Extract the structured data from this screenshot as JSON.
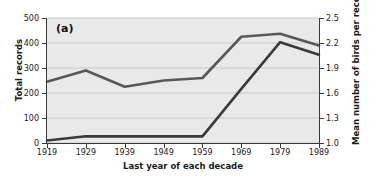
{
  "figure": {
    "panel_label": "(a)",
    "background_color": "#ffffff",
    "plot_background_color": "#e9e9e9",
    "gridline_color": "#c9c9c9"
  },
  "chart_data": {
    "type": "line",
    "title": "",
    "subtitle": "",
    "panel_label": "(a)",
    "xlabel": "Last year of each decade",
    "categories": [
      "1919",
      "1929",
      "1939",
      "1949",
      "1959",
      "1969",
      "1979",
      "1989"
    ],
    "x": [
      1919,
      1929,
      1939,
      1949,
      1959,
      1969,
      1979,
      1989
    ],
    "grid": true,
    "legend_position": "none",
    "axes": [
      {
        "side": "left",
        "label": "Total records",
        "ticks": [
          "0",
          "100",
          "200",
          "300",
          "400",
          "500"
        ],
        "tick_values": [
          0,
          100,
          200,
          300,
          400,
          500
        ],
        "lim": [
          0,
          500
        ]
      },
      {
        "side": "right",
        "label": "Mean number of birds per record",
        "ticks": [
          "1.0",
          "1.3",
          "1.6",
          "1.9",
          "2.2",
          "2.5"
        ],
        "tick_values": [
          1.0,
          1.3,
          1.6,
          1.9,
          2.2,
          2.5
        ],
        "lim": [
          1.0,
          2.5
        ]
      }
    ],
    "series": [
      {
        "name": "Total records",
        "axis": "left",
        "color": "#595959",
        "width": 2.6,
        "values": [
          245,
          290,
          225,
          250,
          260,
          425,
          437,
          390
        ]
      },
      {
        "name": "Mean number of birds per record",
        "axis": "right",
        "color": "#3a3a3a",
        "width": 2.6,
        "values": [
          1.03,
          1.08,
          1.08,
          1.08,
          1.08,
          1.65,
          2.21,
          2.06
        ]
      }
    ]
  }
}
